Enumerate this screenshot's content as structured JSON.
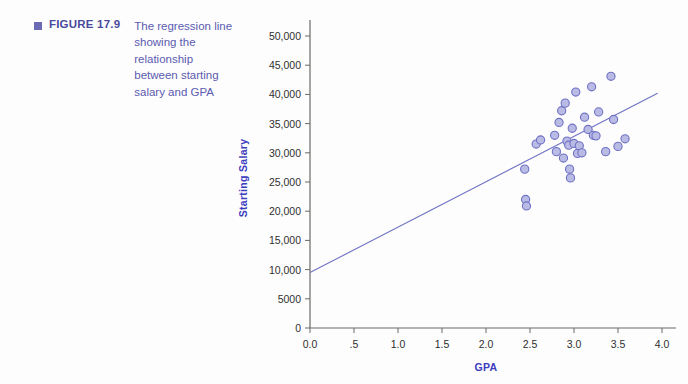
{
  "figure": {
    "bullet_icon": "square-bullet-icon",
    "label": "FIGURE 17.9",
    "caption": "The regression line showing the relationship between starting salary and GPA"
  },
  "colors": {
    "caption_label": "#4a4a9e",
    "caption_text": "#5b5bb0",
    "bullet": "#6a6ab4",
    "marker_fill": "#b9bbe4",
    "marker_stroke": "#6f72c4",
    "regression_line": "#6f72c4",
    "axis": "#6a6a66",
    "axis_title": "#3b3bbd",
    "tick_text": "#2f2f2f"
  },
  "chart_data": {
    "type": "scatter",
    "title": "The regression line showing the relationship between starting salary and GPA",
    "xlabel": "GPA",
    "ylabel": "Starting Salary",
    "xlim": [
      0.0,
      4.0
    ],
    "ylim": [
      0,
      52000
    ],
    "grid": false,
    "legend": null,
    "xticks": [
      0.0,
      0.5,
      1.0,
      1.5,
      2.0,
      2.5,
      3.0,
      3.5,
      4.0
    ],
    "xticklabels": [
      "0.0",
      ".5",
      "1.0",
      "1.5",
      "2.0",
      "2.5",
      "3.0",
      "3.5",
      "4.0"
    ],
    "yticks": [
      0,
      5000,
      10000,
      15000,
      20000,
      25000,
      30000,
      35000,
      40000,
      45000,
      50000
    ],
    "yticklabels": [
      "0",
      "5000",
      "10,000",
      "15,000",
      "20,000",
      "25,000",
      "30,000",
      "35,000",
      "40,000",
      "45,000",
      "50,000"
    ],
    "series": [
      {
        "name": "Students",
        "marker": "circle",
        "points": [
          [
            2.44,
            27200
          ],
          [
            2.45,
            22000
          ],
          [
            2.46,
            20900
          ],
          [
            2.57,
            31500
          ],
          [
            2.62,
            32200
          ],
          [
            2.78,
            33000
          ],
          [
            2.8,
            30200
          ],
          [
            2.83,
            35200
          ],
          [
            2.86,
            37200
          ],
          [
            2.88,
            29100
          ],
          [
            2.9,
            38500
          ],
          [
            2.92,
            32000
          ],
          [
            2.94,
            31300
          ],
          [
            2.95,
            27200
          ],
          [
            2.96,
            25700
          ],
          [
            2.98,
            34200
          ],
          [
            3.0,
            31600
          ],
          [
            3.02,
            40400
          ],
          [
            3.04,
            29900
          ],
          [
            3.06,
            31200
          ],
          [
            3.09,
            30000
          ],
          [
            3.12,
            36100
          ],
          [
            3.16,
            34000
          ],
          [
            3.2,
            41300
          ],
          [
            3.22,
            33000
          ],
          [
            3.25,
            32900
          ],
          [
            3.28,
            37000
          ],
          [
            3.36,
            30200
          ],
          [
            3.42,
            43100
          ],
          [
            3.45,
            35700
          ],
          [
            3.5,
            31100
          ],
          [
            3.58,
            32400
          ]
        ]
      }
    ],
    "regression_line": {
      "x_start": 0.0,
      "y_start": 9500,
      "x_end": 3.95,
      "y_end": 40200
    }
  }
}
